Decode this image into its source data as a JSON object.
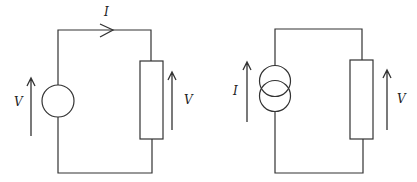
{
  "figure": {
    "circuits": [
      {
        "id": "voltage-source-circuit",
        "source_type": "voltage source",
        "labels": {
          "current": "I",
          "source_voltage": "V",
          "load_voltage": "V"
        }
      },
      {
        "id": "current-source-circuit",
        "source_type": "current source",
        "labels": {
          "source_current": "I",
          "load_voltage": "V"
        }
      }
    ]
  }
}
